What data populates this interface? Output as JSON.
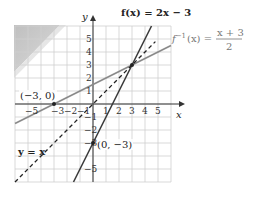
{
  "chart_data": {
    "type": "line",
    "title": "",
    "xlabel": "x",
    "ylabel": "y",
    "xlim": [
      -6,
      6
    ],
    "ylim": [
      -6,
      6
    ],
    "grid": true,
    "x_ticks": [
      "-5",
      "-3",
      "-2",
      "-1",
      "1",
      "2",
      "3",
      "4",
      "5"
    ],
    "y_ticks": [
      "5",
      "4",
      "3",
      "2",
      "1",
      "-1",
      "-2",
      "-3",
      "-5"
    ],
    "series": [
      {
        "name": "f(x) = 2x − 3",
        "style": "solid-dark",
        "equation": "y = 2x - 3",
        "x": [
          -1.5,
          4.5
        ],
        "y": [
          -6,
          6
        ]
      },
      {
        "name": "f^{-1}(x) = (x + 3)/2",
        "style": "solid-gray",
        "equation": "y = (x + 3)/2",
        "x": [
          -6,
          6
        ],
        "y": [
          -1.5,
          4.5
        ]
      },
      {
        "name": "y = x",
        "style": "dashed",
        "equation": "y = x",
        "x": [
          -6,
          4.8
        ],
        "y": [
          -6,
          4.8
        ]
      }
    ],
    "annotations": [
      {
        "text": "(−3, 0)",
        "x": -3,
        "y": 0
      },
      {
        "text": "(0, −3)",
        "x": 0,
        "y": -3
      },
      {
        "text": "intersection",
        "x": 3,
        "y": 3
      }
    ],
    "legend_position": "inline"
  },
  "labels": {
    "axis_x": "x",
    "axis_y": "y",
    "f_label": "f(x) = 2x − 3",
    "finv_prefix": "f",
    "finv_sup": "−1",
    "finv_mid": "(x) =",
    "finv_num": "x + 3",
    "finv_den": "2",
    "identity_label": "y = x",
    "point_a": "(−3, 0)",
    "point_b": "(0, −3)"
  },
  "ticks": {
    "x": [
      {
        "label": "−5",
        "v": -5
      },
      {
        "label": "−3",
        "v": -3
      },
      {
        "label": "−2",
        "v": -2
      },
      {
        "label": "−1",
        "v": -1
      },
      {
        "label": "1",
        "v": 1
      },
      {
        "label": "2",
        "v": 2
      },
      {
        "label": "3",
        "v": 3
      },
      {
        "label": "4",
        "v": 4
      },
      {
        "label": "5",
        "v": 5
      }
    ],
    "y": [
      {
        "label": "5",
        "v": 5
      },
      {
        "label": "4",
        "v": 4
      },
      {
        "label": "3",
        "v": 3
      },
      {
        "label": "2",
        "v": 2
      },
      {
        "label": "1",
        "v": 1
      },
      {
        "label": "−1",
        "v": -1
      },
      {
        "label": "−2",
        "v": -2
      },
      {
        "label": "−3",
        "v": -3
      },
      {
        "label": "−5",
        "v": -5
      }
    ]
  },
  "colors": {
    "grid": "#cfcfcf",
    "axis": "#333333",
    "f_line": "#3a3a3a",
    "finv_line": "#8a8a8a",
    "identity_line": "#222222",
    "shade": "#bdbdbd"
  }
}
